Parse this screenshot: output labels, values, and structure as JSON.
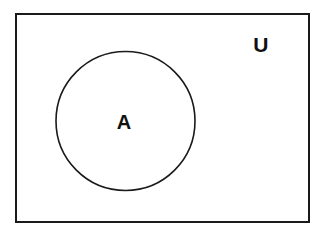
{
  "figure": {
    "type": "venn-diagram",
    "background_color": "#ffffff",
    "stroke_color": "#1a1a1a",
    "fill_color": "#ffffff"
  },
  "universe": {
    "label": "U",
    "shape": "rectangle",
    "x": 15,
    "y": 13,
    "width": 295,
    "height": 210,
    "stroke_width": 2,
    "label_x": 261,
    "label_y": 44
  },
  "sets": [
    {
      "label": "A",
      "shape": "circle",
      "cx": 125.5,
      "cy": 121,
      "r": 69.5,
      "stroke_width": 1.6,
      "label_x": 124,
      "label_y": 122
    }
  ],
  "chart_data": {
    "type": "diagram",
    "regions": [
      {
        "name": "U",
        "description": "universal set rectangle",
        "contains": [
          "A"
        ]
      },
      {
        "name": "A",
        "description": "subset circle inside U",
        "contains": []
      }
    ],
    "labels": [
      "U",
      "A"
    ]
  }
}
